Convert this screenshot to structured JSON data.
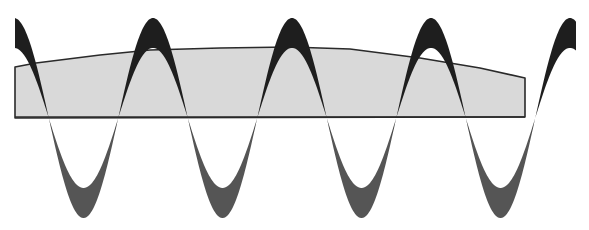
{
  "diagram": {
    "title": "",
    "width": 589,
    "height": 230,
    "colors": {
      "background": "#ffffff",
      "envelope_fill": "#d9d9d9",
      "envelope_stroke": "#2a2a2a",
      "wave_upper": "#1e1e1e",
      "wave_lower": "#555555"
    },
    "envelope": {
      "points": [
        [
          15,
          118
        ],
        [
          15,
          67
        ],
        [
          36,
          63
        ],
        [
          100,
          55
        ],
        [
          150,
          50
        ],
        [
          220,
          48
        ],
        [
          290,
          47
        ],
        [
          350,
          49
        ],
        [
          420,
          58
        ],
        [
          480,
          68
        ],
        [
          525,
          78
        ],
        [
          525,
          117
        ]
      ],
      "baseline_y": 117
    },
    "wave": {
      "x_start": 15,
      "x_end": 576,
      "period": 139,
      "first_peak_x": 153,
      "center_y": 118,
      "outer_amplitude": 100,
      "inner_amplitude": 70,
      "peaks_x": [
        153,
        292,
        431
      ],
      "troughs_x": [
        85,
        222,
        362,
        502
      ]
    }
  }
}
